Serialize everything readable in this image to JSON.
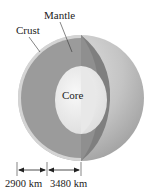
{
  "diagram": {
    "labels": {
      "mantle": "Mantle",
      "crust": "Crust",
      "core": "Core"
    },
    "dimensions": {
      "mantle_thickness": "2900 km",
      "core_radius": "3480 km"
    },
    "colors": {
      "mantle": "#9a9a9a",
      "mantle_section": "#7e7e7e",
      "core": "#eeeeee",
      "surface": "#c8c8c8",
      "crust": "#d8d8d8"
    }
  }
}
